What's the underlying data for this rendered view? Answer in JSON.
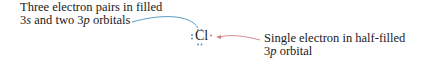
{
  "diagram": {
    "element_symbol": "Cl",
    "left_annotation": {
      "line1": "Three electron pairs in filled",
      "line2_parts": [
        {
          "text": "3",
          "italic": false
        },
        {
          "text": "s",
          "italic": true
        },
        {
          "text": " and two ",
          "italic": false
        },
        {
          "text": "3",
          "italic": false
        },
        {
          "text": "p",
          "italic": true
        },
        {
          "text": " orbitals",
          "italic": false
        }
      ]
    },
    "right_annotation": {
      "line1": "Single electron in half-filled",
      "line2_parts": [
        {
          "text": "3",
          "italic": false
        },
        {
          "text": "p",
          "italic": true
        },
        {
          "text": " orbital",
          "italic": false
        }
      ]
    },
    "colors": {
      "paired_electrons_arrow": "#5b9cc4",
      "single_electron_arrow": "#d47b82",
      "paired_dots": "#4a8fb8",
      "single_dot": "#c56a72"
    },
    "electron_pairs": 3,
    "unpaired_electrons": 1
  }
}
